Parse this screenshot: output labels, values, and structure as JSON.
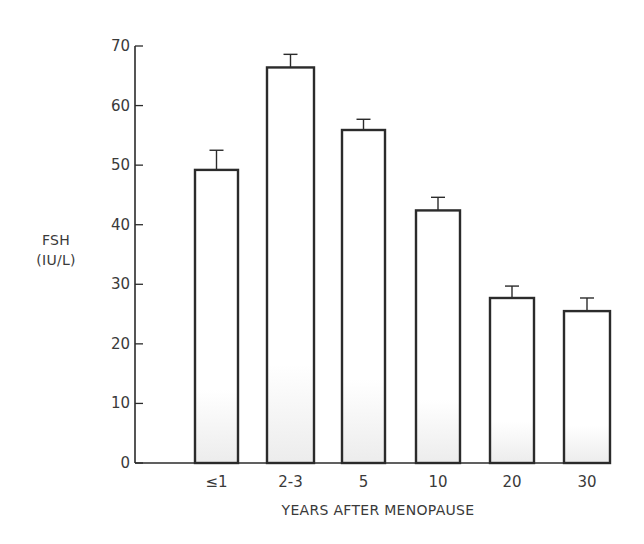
{
  "chart_data": {
    "type": "bar",
    "title": "",
    "xlabel": "YEARS AFTER MENOPAUSE",
    "ylabel": "FSH\n(IU/L)",
    "ylabel_lines": [
      "FSH",
      "(IU/L)"
    ],
    "categories": [
      "≤1",
      "2-3",
      "5",
      "10",
      "20",
      "30"
    ],
    "values": [
      49.2,
      66.4,
      55.9,
      42.4,
      27.7,
      25.5
    ],
    "error_upper": [
      52.5,
      68.6,
      57.7,
      44.6,
      29.7,
      27.7
    ],
    "error_bars": [
      3.3,
      2.2,
      1.8,
      2.2,
      2.0,
      2.2
    ],
    "ylim": [
      0,
      70
    ],
    "yticks": [
      0,
      10,
      20,
      30,
      40,
      50,
      60,
      70
    ],
    "grid": false,
    "legend": null,
    "bar_fill": "#ffffff",
    "bar_edge": "#2b2b2b"
  }
}
